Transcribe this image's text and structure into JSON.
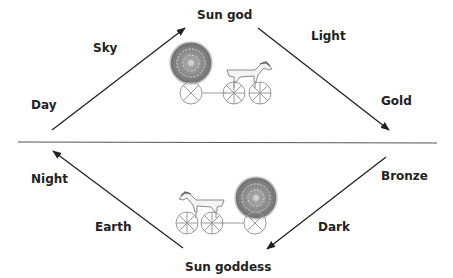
{
  "diagram": {
    "top_half": {
      "start": "Day",
      "along_ascending": "Sky",
      "apex": "Sun god",
      "along_descending": "Light",
      "end": "Gold"
    },
    "bottom_half": {
      "start": "Bronze",
      "along_descending": "Dark",
      "nadir": "Sun goddess",
      "along_ascending": "Earth",
      "end": "Night"
    },
    "illustrations": {
      "top": "sun-chariot-icon (horse pulling sun disk, facing right)",
      "bottom": "sun-chariot-icon (horse pulling sun disk, facing left)"
    },
    "colors": {
      "line": "#222222",
      "divider": "#555555",
      "sun_disk": "#8a8a8a",
      "chariot": "#9a9a9a",
      "text": "#222222"
    }
  }
}
